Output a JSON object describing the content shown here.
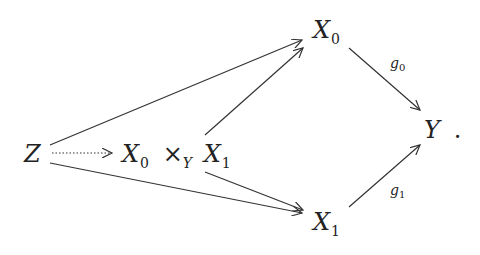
{
  "diagram": {
    "type": "commutative-diagram",
    "nodes": {
      "Z": {
        "label": "Z"
      },
      "P": {
        "base0": "X",
        "sub0": "0",
        "times": "×",
        "subY": "Y",
        "base1": "X",
        "sub1": "1"
      },
      "X0": {
        "base": "X",
        "sub": "0"
      },
      "X1": {
        "base": "X",
        "sub": "1"
      },
      "Y": {
        "label": "Y",
        "punct": "."
      }
    },
    "edges": [
      {
        "from": "Z",
        "to": "P",
        "style": "dotted",
        "label": ""
      },
      {
        "from": "Z",
        "to": "X0",
        "style": "solid",
        "label": ""
      },
      {
        "from": "Z",
        "to": "X1",
        "style": "solid",
        "label": ""
      },
      {
        "from": "P",
        "to": "X0",
        "style": "solid",
        "label": ""
      },
      {
        "from": "P",
        "to": "X1",
        "style": "solid",
        "label": ""
      },
      {
        "from": "X0",
        "to": "Y",
        "style": "solid",
        "label": "g",
        "label_sub": "0"
      },
      {
        "from": "X1",
        "to": "Y",
        "style": "solid",
        "label": "g",
        "label_sub": "1"
      }
    ]
  }
}
